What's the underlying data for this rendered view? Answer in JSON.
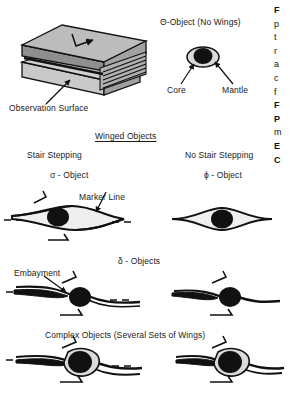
{
  "figure": {
    "background": "#ffffff",
    "ink": "#111111",
    "gray_top": "#b9b9b9",
    "gray_side": "#a0a0a0",
    "gray_front": "#c9c9c9",
    "mantle_fill": "#d9d9d9",
    "core_fill": "#111111"
  },
  "block": {
    "observation_surface_label": "Observation Surface"
  },
  "theta": {
    "title": "Θ-Object (No Wings)",
    "core_label": "Core",
    "mantle_label": "Mantle"
  },
  "winged": {
    "heading": "Winged Objects",
    "left_type": "Stair Stepping",
    "left_name": "σ - Object",
    "right_type": "No Stair Stepping",
    "right_name": "ϕ - Object",
    "marker_line_label": "Marker Line"
  },
  "delta": {
    "heading": "δ - Objects",
    "embayment_label": "Embayment"
  },
  "complex": {
    "heading": "Complex Objects (Several Sets of Wings)"
  },
  "caption_column": {
    "lines": [
      "F",
      "p",
      "t",
      "r",
      "a",
      "c",
      "f",
      "F",
      "P",
      "m",
      "E",
      "C"
    ]
  }
}
